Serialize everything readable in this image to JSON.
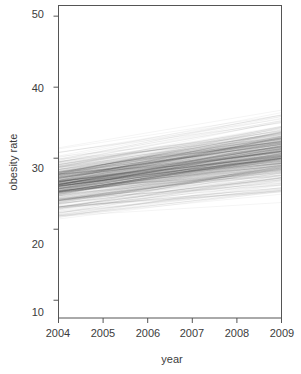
{
  "chart_data": {
    "type": "line",
    "title": "",
    "subtitle": "",
    "xlabel": "year",
    "ylabel": "obesity rate",
    "xlim": [
      2004,
      2009
    ],
    "ylim": [
      7.5,
      51.5
    ],
    "xticks": [
      2004,
      2005,
      2006,
      2007,
      2008,
      2009
    ],
    "xtick_labels": [
      "2004",
      "2005",
      "2006",
      "2007",
      "2008",
      "2009"
    ],
    "yticks": [
      10,
      20,
      30,
      40,
      50
    ],
    "ytick_labels": [
      "10",
      "20",
      "30",
      "40",
      "50"
    ],
    "grid": false,
    "legend": "none",
    "annotations": [],
    "line_color": "#000000",
    "line_opacity": 0.06,
    "n_lines": 420,
    "x": [
      2004,
      2009
    ],
    "envelope": {
      "x": [
        2004,
        2009
      ],
      "min": [
        19.0,
        23.4
      ],
      "q25": [
        24.3,
        28.6
      ],
      "median": [
        26.2,
        30.6
      ],
      "q75": [
        28.0,
        32.6
      ],
      "max": [
        31.6,
        38.0
      ]
    },
    "series": [
      {
        "name": "ensemble-core-low",
        "values": [
          24.5,
          29.0
        ]
      },
      {
        "name": "ensemble-core-mid",
        "values": [
          26.3,
          30.7
        ]
      },
      {
        "name": "ensemble-core-high",
        "values": [
          27.9,
          32.5
        ]
      },
      {
        "name": "ensemble-upper-fringe",
        "values": [
          31.4,
          37.8
        ]
      },
      {
        "name": "ensemble-lower-fringe",
        "values": [
          19.2,
          23.6
        ]
      }
    ],
    "stats": {
      "intercept_2004_mean": 26.2,
      "intercept_2004_sd": 1.9,
      "value_2009_mean": 30.6,
      "value_2009_sd": 2.6,
      "slope_mean_per_year": 0.88,
      "slope_sd_per_year": 0.22
    }
  },
  "axes": {
    "y_title": "obesity rate",
    "x_title": "year"
  }
}
